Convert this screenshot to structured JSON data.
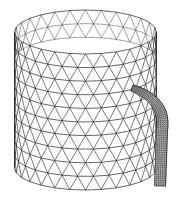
{
  "figure": {
    "background": "#ffffff",
    "line_color": "#222222",
    "cylinder": {
      "cx": 85.5,
      "top_y": 32,
      "bottom_y": 168,
      "rx": 71,
      "ry": 22,
      "rings": 10,
      "segments": 28
    },
    "tube": {
      "start": [
        132,
        88
      ],
      "control": [
        166,
        100
      ],
      "end_top": [
        162,
        130
      ],
      "end": [
        160,
        186
      ],
      "width": 11,
      "mesh_density": "fine"
    }
  }
}
